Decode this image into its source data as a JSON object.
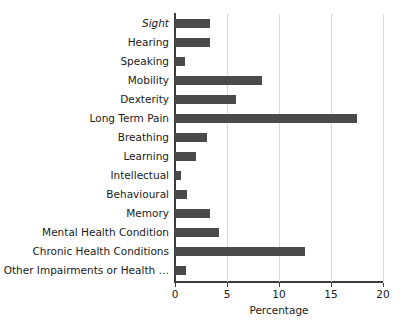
{
  "chart_data": {
    "type": "bar",
    "orientation": "horizontal",
    "title": "",
    "xlabel": "Percentage",
    "ylabel": "",
    "xlim": [
      0,
      20
    ],
    "xticks": [
      0,
      5,
      10,
      15,
      20
    ],
    "grid": "vertical",
    "legend": "none",
    "bar_color": "#4a4a4a",
    "gridline_color": "#d8d8d8",
    "axis_color": "#3c3c3c",
    "categories": [
      "Sight",
      "Hearing",
      "Speaking",
      "Mobility",
      "Dexterity",
      "Long Term Pain",
      "Breathing",
      "Learning",
      "Intellectual",
      "Behavioural",
      "Memory",
      "Mental Health Condition",
      "Chronic Health Conditions",
      "Other Impairments or Health …"
    ],
    "values": [
      3.4,
      3.4,
      1.0,
      8.4,
      5.9,
      17.5,
      3.1,
      2.0,
      0.6,
      1.2,
      3.4,
      4.2,
      12.5,
      1.1
    ],
    "emphasis": [
      "Sight"
    ]
  }
}
